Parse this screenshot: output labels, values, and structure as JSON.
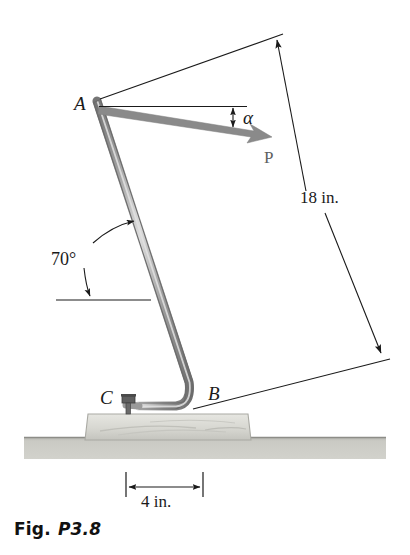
{
  "figure": {
    "caption_prefix": "Fig.",
    "caption_number": "P3.8",
    "background_color": "#ffffff"
  },
  "labels": {
    "point_a": "A",
    "point_b": "B",
    "point_c": "C",
    "force_p": "P",
    "angle_alpha": "α",
    "angle_incline": "70°",
    "dim_length": "18 in.",
    "dim_base": "4 in."
  },
  "colors": {
    "rod_body": "#9a9a9a",
    "rod_edge": "#6f6f6f",
    "rod_highlight": "#d8d8d8",
    "force_arrow": "#8a8a8a",
    "slab_fill": "#d9d9d4",
    "slab_edge": "#a8a8a2",
    "ground_fill": "#c2c2bd",
    "ground_edge": "#8d8d88",
    "dimension_line": "#1a1a1a",
    "text": "#1a1a1a",
    "bolt": "#5a5a5a"
  },
  "geometry": {
    "point_a": {
      "x": 97,
      "y": 101
    },
    "point_b": {
      "x": 196,
      "y": 404
    },
    "point_c": {
      "x": 131,
      "y": 404
    },
    "force_tip": {
      "x": 270,
      "y": 137
    },
    "dim_18_top": {
      "x": 276,
      "y": 38
    },
    "dim_18_bottom": {
      "x": 383,
      "y": 355
    },
    "dim_4_left": {
      "x": 126,
      "y": 487
    },
    "dim_4_right": {
      "x": 202,
      "y": 487
    },
    "slab": {
      "x": 85,
      "y": 414,
      "width": 166,
      "height": 26
    },
    "ground": {
      "x": 24,
      "y": 437,
      "width": 362,
      "height": 22
    }
  }
}
